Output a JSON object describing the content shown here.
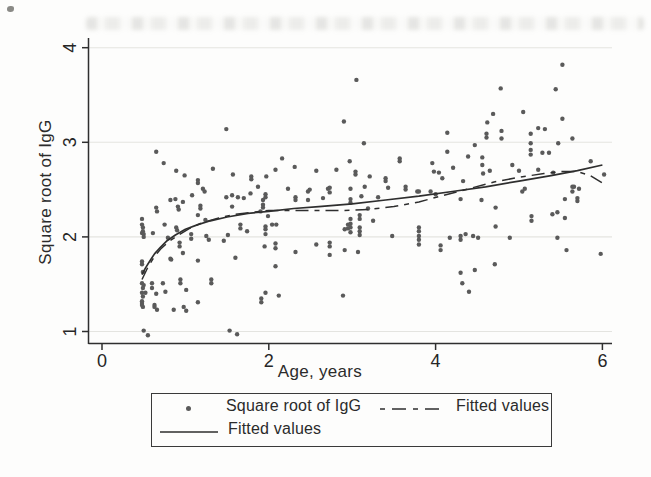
{
  "figure_type": "scanned statistical scatter plot with fitted curves",
  "legend": {
    "items": [
      {
        "marker": "dot",
        "label": "Square root of IgG"
      },
      {
        "marker": "dash-dot-line",
        "label": "Fitted values"
      },
      {
        "marker": "solid-line",
        "label": "Fitted values"
      }
    ]
  },
  "colors": {
    "dot": "#5a5a5a",
    "line": "#2e2e2e",
    "grid": "#e4e4e0",
    "axis": "#2f2f2f",
    "text": "#262626",
    "background": "#fdfdfc",
    "legend_border": "#3a3a3a"
  },
  "chart_data": {
    "type": "scatter",
    "title": "",
    "xlabel": "Age, years",
    "ylabel": "Square root of IgG",
    "xlim": [
      0,
      6.3
    ],
    "ylim": [
      0.93,
      4.1
    ],
    "x_ticks": [
      0,
      2,
      4,
      6
    ],
    "y_ticks": [
      1,
      2,
      3,
      4
    ],
    "grid": "horizontal",
    "legend_position": "bottom",
    "series": [
      {
        "name": "Square root of IgG",
        "type": "scatter",
        "points": [
          [
            0.48,
            2.19
          ],
          [
            0.48,
            2.13
          ],
          [
            0.49,
            2.1
          ],
          [
            0.49,
            2.06
          ],
          [
            0.48,
            2.04
          ],
          [
            0.5,
            2.03
          ],
          [
            0.5,
            2.0
          ],
          [
            0.48,
            1.74
          ],
          [
            0.48,
            1.71
          ],
          [
            0.49,
            1.63
          ],
          [
            0.48,
            1.51
          ],
          [
            0.5,
            1.49
          ],
          [
            0.49,
            1.46
          ],
          [
            0.48,
            1.41
          ],
          [
            0.52,
            1.41
          ],
          [
            0.49,
            1.37
          ],
          [
            0.48,
            1.32
          ],
          [
            0.48,
            1.3
          ],
          [
            0.48,
            1.28
          ],
          [
            0.49,
            1.26
          ],
          [
            0.5,
            1.01
          ],
          [
            0.55,
            0.96
          ],
          [
            0.61,
            2.04
          ],
          [
            0.65,
            2.9
          ],
          [
            0.65,
            2.31
          ],
          [
            0.66,
            2.27
          ],
          [
            0.6,
            1.51
          ],
          [
            0.6,
            1.46
          ],
          [
            0.65,
            1.4
          ],
          [
            0.63,
            1.28
          ],
          [
            0.63,
            1.26
          ],
          [
            0.66,
            1.23
          ],
          [
            0.74,
            2.78
          ],
          [
            0.75,
            2.13
          ],
          [
            0.79,
            1.99
          ],
          [
            0.82,
            2.39
          ],
          [
            0.82,
            1.77
          ],
          [
            0.83,
            1.76
          ],
          [
            0.73,
            1.51
          ],
          [
            0.76,
            1.42
          ],
          [
            0.86,
            1.23
          ],
          [
            0.89,
            2.7
          ],
          [
            0.88,
            2.4
          ],
          [
            0.91,
            2.32
          ],
          [
            0.92,
            2.29
          ],
          [
            0.97,
            2.37
          ],
          [
            0.99,
            2.65
          ],
          [
            0.89,
            2.1
          ],
          [
            0.9,
            2.07
          ],
          [
            0.93,
            1.94
          ],
          [
            0.93,
            1.9
          ],
          [
            0.97,
            1.83
          ],
          [
            0.94,
            1.55
          ],
          [
            0.94,
            1.51
          ],
          [
            0.98,
            1.26
          ],
          [
            1.01,
            1.44
          ],
          [
            1.01,
            1.22
          ],
          [
            1.08,
            2.44
          ],
          [
            1.07,
            2.03
          ],
          [
            1.07,
            1.98
          ],
          [
            1.15,
            2.6
          ],
          [
            1.15,
            2.57
          ],
          [
            1.15,
            2.23
          ],
          [
            1.15,
            1.75
          ],
          [
            1.15,
            1.31
          ],
          [
            1.21,
            2.51
          ],
          [
            1.18,
            2.33
          ],
          [
            1.18,
            2.3
          ],
          [
            1.24,
            2.18
          ],
          [
            1.25,
            2.01
          ],
          [
            1.23,
            2.48
          ],
          [
            1.28,
            1.97
          ],
          [
            1.33,
            2.72
          ],
          [
            1.31,
            1.55
          ],
          [
            1.31,
            1.51
          ],
          [
            1.46,
            1.96
          ],
          [
            1.49,
            3.14
          ],
          [
            1.49,
            2.42
          ],
          [
            1.51,
            2.02
          ],
          [
            1.53,
            1.01
          ],
          [
            1.56,
            2.44
          ],
          [
            1.56,
            2.32
          ],
          [
            1.57,
            2.66
          ],
          [
            1.6,
            1.78
          ],
          [
            1.62,
            0.97
          ],
          [
            1.63,
            2.42
          ],
          [
            1.66,
            2.13
          ],
          [
            1.66,
            2.09
          ],
          [
            1.7,
            2.41
          ],
          [
            1.74,
            2.06
          ],
          [
            1.78,
            2.46
          ],
          [
            1.79,
            2.64
          ],
          [
            1.79,
            2.61
          ],
          [
            1.87,
            2.53
          ],
          [
            1.9,
            2.27
          ],
          [
            1.95,
            1.9
          ],
          [
            1.96,
            2.45
          ],
          [
            1.96,
            2.42
          ],
          [
            1.97,
            2.64
          ],
          [
            1.93,
            2.39
          ],
          [
            1.93,
            2.34
          ],
          [
            1.93,
            2.31
          ],
          [
            1.99,
            2.22
          ],
          [
            1.96,
            2.11
          ],
          [
            1.96,
            2.08
          ],
          [
            1.96,
            2.03
          ],
          [
            1.96,
            1.41
          ],
          [
            1.91,
            1.35
          ],
          [
            1.91,
            1.31
          ],
          [
            2.04,
            2.13
          ],
          [
            2.09,
            2.13
          ],
          [
            2.08,
            2.71
          ],
          [
            2.16,
            2.83
          ],
          [
            2.08,
            1.93
          ],
          [
            2.08,
            1.88
          ],
          [
            2.08,
            1.69
          ],
          [
            2.12,
            1.38
          ],
          [
            2.23,
            2.51
          ],
          [
            2.31,
            2.74
          ],
          [
            2.32,
            2.42
          ],
          [
            2.32,
            2.39
          ],
          [
            2.32,
            1.84
          ],
          [
            2.47,
            2.48
          ],
          [
            2.47,
            2.39
          ],
          [
            2.49,
            2.5
          ],
          [
            2.57,
            2.7
          ],
          [
            2.57,
            1.92
          ],
          [
            2.65,
            2.41
          ],
          [
            2.71,
            2.51
          ],
          [
            2.73,
            2.52
          ],
          [
            2.73,
            2.47
          ],
          [
            2.73,
            1.94
          ],
          [
            2.73,
            1.9
          ],
          [
            2.73,
            1.81
          ],
          [
            2.81,
            2.71
          ],
          [
            2.9,
            3.22
          ],
          [
            2.91,
            2.08
          ],
          [
            2.91,
            1.86
          ],
          [
            2.89,
            1.38
          ],
          [
            2.95,
            2.13
          ],
          [
            2.95,
            2.09
          ],
          [
            2.97,
            2.8
          ],
          [
            2.98,
            2.51
          ],
          [
            2.98,
            2.4
          ],
          [
            2.98,
            2.36
          ],
          [
            2.98,
            2.19
          ],
          [
            2.98,
            2.14
          ],
          [
            2.98,
            2.1
          ],
          [
            2.98,
            2.05
          ],
          [
            3.05,
            3.66
          ],
          [
            3.04,
            2.69
          ],
          [
            3.04,
            2.66
          ],
          [
            3.07,
            1.84
          ],
          [
            3.09,
            2.23
          ],
          [
            3.09,
            2.19
          ],
          [
            3.09,
            2.1
          ],
          [
            3.09,
            2.06
          ],
          [
            3.09,
            2.02
          ],
          [
            3.11,
            2.43
          ],
          [
            3.14,
            2.99
          ],
          [
            3.15,
            2.53
          ],
          [
            3.19,
            2.3
          ],
          [
            3.21,
            2.64
          ],
          [
            3.25,
            2.17
          ],
          [
            3.31,
            2.42
          ],
          [
            3.4,
            2.62
          ],
          [
            3.4,
            2.59
          ],
          [
            3.43,
            2.52
          ],
          [
            3.48,
            2.01
          ],
          [
            3.57,
            2.83
          ],
          [
            3.57,
            2.8
          ],
          [
            3.64,
            2.53
          ],
          [
            3.64,
            2.5
          ],
          [
            3.78,
            2.48
          ],
          [
            3.8,
            2.48
          ],
          [
            3.8,
            2.1
          ],
          [
            3.8,
            2.06
          ],
          [
            3.8,
            2.01
          ],
          [
            3.8,
            1.97
          ],
          [
            3.8,
            1.92
          ],
          [
            3.94,
            2.48
          ],
          [
            3.96,
            2.78
          ],
          [
            3.98,
            2.69
          ],
          [
            4.0,
            2.45
          ],
          [
            4.04,
            2.68
          ],
          [
            4.06,
            1.91
          ],
          [
            4.06,
            1.86
          ],
          [
            4.08,
            2.62
          ],
          [
            4.14,
            3.1
          ],
          [
            4.14,
            2.9
          ],
          [
            4.17,
            1.99
          ],
          [
            4.21,
            2.73
          ],
          [
            4.3,
            2.4
          ],
          [
            4.3,
            2.01
          ],
          [
            4.3,
            1.97
          ],
          [
            4.3,
            1.62
          ],
          [
            4.32,
            1.51
          ],
          [
            4.33,
            2.59
          ],
          [
            4.36,
            2.03
          ],
          [
            4.39,
            2.85
          ],
          [
            4.4,
            1.42
          ],
          [
            4.45,
            2.01
          ],
          [
            4.47,
            2.97
          ],
          [
            4.47,
            1.65
          ],
          [
            4.51,
            1.99
          ],
          [
            4.55,
            2.39
          ],
          [
            4.56,
            2.84
          ],
          [
            4.56,
            2.76
          ],
          [
            4.57,
            2.67
          ],
          [
            4.61,
            3.09
          ],
          [
            4.61,
            3.05
          ],
          [
            4.62,
            3.21
          ],
          [
            4.65,
            2.7
          ],
          [
            4.69,
            3.3
          ],
          [
            4.71,
            1.71
          ],
          [
            4.72,
            2.31
          ],
          [
            4.72,
            2.11
          ],
          [
            4.78,
            3.57
          ],
          [
            4.79,
            3.12
          ],
          [
            4.79,
            3.04
          ],
          [
            4.89,
            1.99
          ],
          [
            4.92,
            2.76
          ],
          [
            5.0,
            2.7
          ],
          [
            5.04,
            2.48
          ],
          [
            5.05,
            3.32
          ],
          [
            5.07,
            2.51
          ],
          [
            5.14,
            3.09
          ],
          [
            5.14,
            2.99
          ],
          [
            5.14,
            2.92
          ],
          [
            5.14,
            2.87
          ],
          [
            5.15,
            2.22
          ],
          [
            5.15,
            2.17
          ],
          [
            5.23,
            3.15
          ],
          [
            5.23,
            2.71
          ],
          [
            5.28,
            2.89
          ],
          [
            5.31,
            3.14
          ],
          [
            5.36,
            2.89
          ],
          [
            5.4,
            2.24
          ],
          [
            5.41,
            2.68
          ],
          [
            5.44,
            3.56
          ],
          [
            5.46,
            2.26
          ],
          [
            5.46,
            1.99
          ],
          [
            5.47,
            2.99
          ],
          [
            5.52,
            3.82
          ],
          [
            5.52,
            3.25
          ],
          [
            5.55,
            2.4
          ],
          [
            5.55,
            2.2
          ],
          [
            5.57,
            1.86
          ],
          [
            5.64,
            3.04
          ],
          [
            5.64,
            2.53
          ],
          [
            5.64,
            2.48
          ],
          [
            5.66,
            2.53
          ],
          [
            5.7,
            2.41
          ],
          [
            5.7,
            2.38
          ],
          [
            5.72,
            2.51
          ],
          [
            5.86,
            2.8
          ],
          [
            5.98,
            1.82
          ],
          [
            6.02,
            2.66
          ]
        ]
      },
      {
        "name": "Fitted values",
        "type": "line",
        "style": "solid",
        "points": [
          [
            0.48,
            1.6
          ],
          [
            0.52,
            1.67
          ],
          [
            0.57,
            1.74
          ],
          [
            0.63,
            1.82
          ],
          [
            0.7,
            1.89
          ],
          [
            0.78,
            1.96
          ],
          [
            0.88,
            2.02
          ],
          [
            1.0,
            2.08
          ],
          [
            1.15,
            2.13
          ],
          [
            1.3,
            2.17
          ],
          [
            1.5,
            2.21
          ],
          [
            1.75,
            2.25
          ],
          [
            2.0,
            2.27
          ],
          [
            2.3,
            2.3
          ],
          [
            2.6,
            2.32
          ],
          [
            3.0,
            2.35
          ],
          [
            3.4,
            2.39
          ],
          [
            3.8,
            2.43
          ],
          [
            4.2,
            2.48
          ],
          [
            4.6,
            2.53
          ],
          [
            5.0,
            2.59
          ],
          [
            5.4,
            2.65
          ],
          [
            5.7,
            2.7
          ],
          [
            6.0,
            2.76
          ]
        ]
      },
      {
        "name": "Fitted values",
        "type": "line",
        "style": "dash-dot",
        "points": [
          [
            0.48,
            1.55
          ],
          [
            0.55,
            1.68
          ],
          [
            0.62,
            1.78
          ],
          [
            0.7,
            1.87
          ],
          [
            0.8,
            1.95
          ],
          [
            0.92,
            2.02
          ],
          [
            1.05,
            2.09
          ],
          [
            1.2,
            2.15
          ],
          [
            1.4,
            2.2
          ],
          [
            1.6,
            2.24
          ],
          [
            1.8,
            2.26
          ],
          [
            2.0,
            2.28
          ],
          [
            2.3,
            2.28
          ],
          [
            2.6,
            2.28
          ],
          [
            2.9,
            2.28
          ],
          [
            3.2,
            2.29
          ],
          [
            3.5,
            2.32
          ],
          [
            3.8,
            2.37
          ],
          [
            4.1,
            2.44
          ],
          [
            4.4,
            2.51
          ],
          [
            4.7,
            2.58
          ],
          [
            5.0,
            2.63
          ],
          [
            5.3,
            2.67
          ],
          [
            5.5,
            2.69
          ],
          [
            5.7,
            2.69
          ],
          [
            5.85,
            2.65
          ],
          [
            6.0,
            2.57
          ]
        ]
      }
    ]
  }
}
